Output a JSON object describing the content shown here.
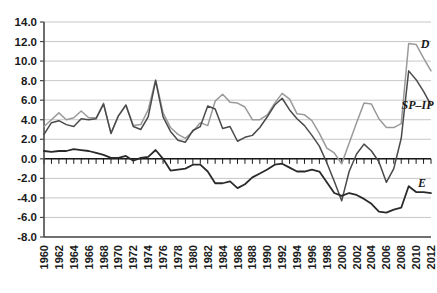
{
  "chart_data": {
    "type": "line",
    "title": "",
    "xlabel": "",
    "ylabel": "",
    "grid": true,
    "legend_position": "inline-right",
    "xlim": [
      1960,
      2012
    ],
    "ylim": [
      -8.0,
      14.0
    ],
    "ytick_step": 2.0,
    "xtick_step": 2,
    "minor_xticks": true,
    "x": [
      1960,
      1961,
      1962,
      1963,
      1964,
      1965,
      1966,
      1967,
      1968,
      1969,
      1970,
      1971,
      1972,
      1973,
      1974,
      1975,
      1976,
      1977,
      1978,
      1979,
      1980,
      1981,
      1982,
      1983,
      1984,
      1985,
      1986,
      1987,
      1988,
      1989,
      1990,
      1991,
      1992,
      1993,
      1994,
      1995,
      1996,
      1997,
      1998,
      1999,
      2000,
      2001,
      2002,
      2003,
      2004,
      2005,
      2006,
      2007,
      2008,
      2009,
      2010,
      2011,
      2012
    ],
    "ytick_labels": [
      "14.0",
      "12.0",
      "10.0",
      "8.0",
      "6.0",
      "4.0",
      "2.0",
      "0.0",
      "-2.0",
      "-4.0",
      "-6.0",
      "-8.0"
    ],
    "ytick_values": [
      14.0,
      12.0,
      10.0,
      8.0,
      6.0,
      4.0,
      2.0,
      0.0,
      -2.0,
      -4.0,
      -6.0,
      -8.0
    ],
    "xtick_labels": [
      "1960",
      "1962",
      "1964",
      "1966",
      "1968",
      "1970",
      "1972",
      "1974",
      "1976",
      "1978",
      "1980",
      "1982",
      "1984",
      "1986",
      "1988",
      "1990",
      "1992",
      "1994",
      "1996",
      "1998",
      "2000",
      "2002",
      "2004",
      "2006",
      "2008",
      "2010",
      "2012"
    ],
    "series": [
      {
        "name": "D",
        "label": "D",
        "color": "#9a9a9a",
        "width": 1.5,
        "label_x": 2011.2,
        "label_y": 11.3,
        "values": [
          3.3,
          4.0,
          4.7,
          4.0,
          4.2,
          4.9,
          4.2,
          4.2,
          5.7,
          2.6,
          4.4,
          5.5,
          3.4,
          3.5,
          5.0,
          8.1,
          4.7,
          3.2,
          2.5,
          2.1,
          2.8,
          3.7,
          3.4,
          5.9,
          6.6,
          5.8,
          5.7,
          5.3,
          4.0,
          4.0,
          4.5,
          5.7,
          6.7,
          6.1,
          4.6,
          4.5,
          3.9,
          2.6,
          1.1,
          0.6,
          -0.5,
          1.6,
          3.7,
          5.7,
          5.6,
          4.1,
          3.2,
          3.2,
          3.6,
          11.8,
          11.7,
          10.3,
          9.0
        ]
      },
      {
        "name": "SP-IP",
        "label": "SP–IP",
        "color": "#4a4a4a",
        "width": 1.5,
        "label_x": 2010.2,
        "label_y": 5.1,
        "values": [
          2.5,
          3.7,
          3.9,
          3.5,
          3.3,
          4.1,
          4.0,
          4.1,
          5.6,
          2.6,
          4.4,
          5.5,
          3.3,
          3.0,
          4.3,
          8.0,
          4.3,
          2.8,
          1.9,
          1.7,
          2.9,
          3.3,
          5.4,
          5.1,
          3.1,
          3.3,
          1.8,
          2.2,
          2.4,
          3.2,
          4.3,
          5.5,
          6.2,
          5.0,
          4.1,
          3.4,
          2.4,
          1.3,
          -0.4,
          -2.3,
          -4.3,
          -1.3,
          0.5,
          1.5,
          0.8,
          -0.3,
          -2.4,
          -1.0,
          2.1,
          9.0,
          8.1,
          6.9,
          5.5
        ]
      },
      {
        "name": "E",
        "label": "E",
        "color": "#2a2a2a",
        "width": 1.8,
        "label_x": 2010.8,
        "label_y": -2.9,
        "values": [
          0.8,
          0.7,
          0.8,
          0.8,
          1.0,
          0.9,
          0.8,
          0.6,
          0.4,
          0.1,
          0.1,
          0.3,
          -0.2,
          0.1,
          0.2,
          0.9,
          0.0,
          -1.2,
          -1.1,
          -1.0,
          -0.6,
          -0.6,
          -1.3,
          -2.5,
          -2.5,
          -2.3,
          -3.0,
          -2.6,
          -1.9,
          -1.5,
          -1.1,
          -0.6,
          -0.5,
          -0.9,
          -1.3,
          -1.3,
          -1.1,
          -1.3,
          -2.4,
          -3.5,
          -3.8,
          -3.5,
          -3.7,
          -4.1,
          -4.6,
          -5.4,
          -5.5,
          -5.2,
          -5.0,
          -2.8,
          -3.4,
          -3.4,
          -3.5
        ]
      }
    ]
  }
}
